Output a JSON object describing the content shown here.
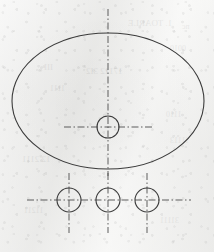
{
  "document": {
    "kind": "engineering-drawing",
    "view": "top-view",
    "title": "Ellipse with four bolt-hole circles",
    "background_color": "#f3f3f2",
    "line_color": "#3b3b3b",
    "centerline_color": "#555555"
  },
  "canvas": {
    "width": 214,
    "height": 252
  },
  "geometry": {
    "ellipse": {
      "label": "outer ellipse outline",
      "cx": 108,
      "cy": 101,
      "rx": 96,
      "ry": 68,
      "stroke_width": 1.1
    },
    "upper_circle": {
      "label": "centre hole",
      "cx": 108,
      "cy": 127,
      "r": 11,
      "stroke_width": 1.1
    },
    "lower_circles": [
      {
        "label": "left hole",
        "cx": 69,
        "cy": 200,
        "r": 12,
        "stroke_width": 1.1
      },
      {
        "label": "middle hole",
        "cx": 108,
        "cy": 200,
        "r": 12,
        "stroke_width": 1.1
      },
      {
        "label": "right hole",
        "cx": 147,
        "cy": 200,
        "r": 12,
        "stroke_width": 1.1
      }
    ]
  },
  "centerlines": {
    "style": "dash-dot chain line",
    "dash_pattern": "7 2.5 1.5 2.5",
    "stroke_width": 0.95,
    "vertical": [
      {
        "label": "main vertical axis",
        "x": 108,
        "y1": 9,
        "y2": 176
      },
      {
        "label": "left hole axis",
        "x": 69,
        "y1": 173,
        "y2": 233
      },
      {
        "label": "middle hole axis",
        "x": 108,
        "y1": 173,
        "y2": 233
      },
      {
        "label": "right hole axis",
        "x": 147,
        "y1": 173,
        "y2": 233
      }
    ],
    "horizontal": [
      {
        "label": "centre hole axis",
        "y": 127,
        "x1": 64,
        "x2": 154
      },
      {
        "label": "lower holes axis",
        "y": 200,
        "x1": 27,
        "x2": 191
      }
    ]
  },
  "showthrough": {
    "label": "faint reverse-side print bleed",
    "lines": [
      {
        "text": "1. TOARLE",
        "x": 128,
        "y": 18,
        "size": 9
      },
      {
        "text": "nc",
        "x": 182,
        "y": 22,
        "size": 8
      },
      {
        "text": "0010",
        "x": 170,
        "y": 44,
        "size": 8
      },
      {
        "text": "III",
        "x": 44,
        "y": 62,
        "size": 9
      },
      {
        "text": "17112 3I2",
        "x": 86,
        "y": 66,
        "size": 9
      },
      {
        "text": "1111",
        "x": 50,
        "y": 84,
        "size": 8
      },
      {
        "text": "1110",
        "x": 166,
        "y": 110,
        "size": 8
      },
      {
        "text": "11113",
        "x": 170,
        "y": 136,
        "size": 8
      },
      {
        "text": "12 2111",
        "x": 22,
        "y": 154,
        "size": 9
      },
      {
        "text": "11211",
        "x": 24,
        "y": 206,
        "size": 8
      },
      {
        "text": "31111",
        "x": 160,
        "y": 216,
        "size": 8
      }
    ]
  }
}
